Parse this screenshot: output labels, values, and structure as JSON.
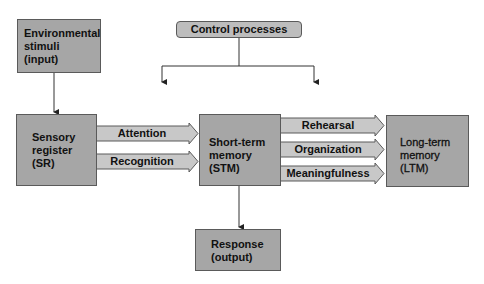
{
  "diagram": {
    "type": "flowchart",
    "nodes": {
      "environmental_stimuli": {
        "label": "Environmental\nstimuli\n(input)"
      },
      "control_processes": {
        "label": "Control processes"
      },
      "sensory_register": {
        "label": "Sensory\nregister\n(SR)"
      },
      "short_term_memory": {
        "label": "Short-term\nmemory\n(STM)"
      },
      "long_term_memory": {
        "label": "Long-term\nmemory\n(LTM)"
      },
      "response": {
        "label": "Response\n(output)"
      }
    },
    "edges": {
      "attention": {
        "label": "Attention",
        "from": "Sensory register (SR)",
        "to": "Short-term memory (STM)"
      },
      "recognition": {
        "label": "Recognition",
        "from": "Sensory register (SR)",
        "to": "Short-term memory (STM)"
      },
      "rehearsal": {
        "label": "Rehearsal",
        "from": "Short-term memory (STM)",
        "to": "Long-term memory (LTM)"
      },
      "organization": {
        "label": "Organization",
        "from": "Short-term memory (STM)",
        "to": "Long-term memory (LTM)"
      },
      "meaningfulness": {
        "label": "Meaningfulness",
        "from": "Short-term memory (STM)",
        "to": "Long-term memory (LTM)"
      }
    },
    "colors": {
      "box_fill": "#a6a6a6",
      "control_fill": "#bdbdbd",
      "arrow_fill": "#c8c8c8",
      "stroke": "#5a5a5a",
      "line": "#333333"
    }
  }
}
